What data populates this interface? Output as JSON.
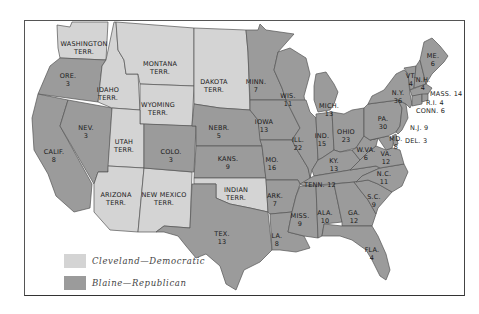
{
  "map": {
    "title": "Presidential Election of 1884",
    "colors": {
      "democrat": "#d4d4d4",
      "republican": "#9b9b9b",
      "border": "#555555"
    },
    "legend": [
      {
        "label": "Cleveland—Democratic",
        "party": "democrat"
      },
      {
        "label": "Blaine—Republican",
        "party": "republican"
      }
    ],
    "regions": [
      {
        "name": "WASHINGTON",
        "sub": "TERR.",
        "votes": null,
        "party": "territory"
      },
      {
        "name": "ORE.",
        "votes": "3",
        "party": "republican"
      },
      {
        "name": "CALIF.",
        "votes": "8",
        "party": "republican"
      },
      {
        "name": "NEV.",
        "votes": "3",
        "party": "republican"
      },
      {
        "name": "IDAHO",
        "sub": "TERR.",
        "votes": null,
        "party": "territory"
      },
      {
        "name": "MONTANA",
        "sub": "TERR.",
        "votes": null,
        "party": "territory"
      },
      {
        "name": "WYOMING",
        "sub": "TERR.",
        "votes": null,
        "party": "territory"
      },
      {
        "name": "UTAH",
        "sub": "TERR.",
        "votes": null,
        "party": "territory"
      },
      {
        "name": "ARIZONA",
        "sub": "TERR.",
        "votes": null,
        "party": "territory"
      },
      {
        "name": "NEW MEXICO",
        "sub": "TERR.",
        "votes": null,
        "party": "territory"
      },
      {
        "name": "DAKOTA",
        "sub": "TERR.",
        "votes": null,
        "party": "territory"
      },
      {
        "name": "COLO.",
        "votes": "3",
        "party": "republican"
      },
      {
        "name": "NEBR.",
        "votes": "5",
        "party": "republican"
      },
      {
        "name": "KANS.",
        "votes": "9",
        "party": "republican"
      },
      {
        "name": "INDIAN",
        "sub": "TERR.",
        "votes": null,
        "party": "territory"
      },
      {
        "name": "TEX.",
        "votes": "13",
        "party": "democrat"
      },
      {
        "name": "MINN.",
        "votes": "7",
        "party": "republican"
      },
      {
        "name": "IOWA",
        "votes": "13",
        "party": "republican"
      },
      {
        "name": "MO.",
        "votes": "16",
        "party": "democrat"
      },
      {
        "name": "ARK.",
        "votes": "7",
        "party": "democrat"
      },
      {
        "name": "LA.",
        "votes": "8",
        "party": "democrat"
      },
      {
        "name": "WIS.",
        "votes": "11",
        "party": "republican"
      },
      {
        "name": "ILL.",
        "votes": "22",
        "party": "republican"
      },
      {
        "name": "MICH.",
        "votes": "13",
        "party": "republican"
      },
      {
        "name": "IND.",
        "votes": "15",
        "party": "democrat"
      },
      {
        "name": "OHIO",
        "votes": "23",
        "party": "republican"
      },
      {
        "name": "KY.",
        "votes": "13",
        "party": "democrat"
      },
      {
        "name": "TENN.",
        "votes": "12",
        "party": "democrat"
      },
      {
        "name": "MISS.",
        "votes": "9",
        "party": "democrat"
      },
      {
        "name": "ALA.",
        "votes": "10",
        "party": "democrat"
      },
      {
        "name": "GA.",
        "votes": "12",
        "party": "democrat"
      },
      {
        "name": "FLA.",
        "votes": "4",
        "party": "democrat"
      },
      {
        "name": "S.C.",
        "votes": "9",
        "party": "democrat"
      },
      {
        "name": "N.C.",
        "votes": "11",
        "party": "democrat"
      },
      {
        "name": "VA.",
        "votes": "12",
        "party": "democrat"
      },
      {
        "name": "W.VA.",
        "votes": "6",
        "party": "democrat"
      },
      {
        "name": "MD.",
        "votes": "8",
        "party": "democrat"
      },
      {
        "name": "DEL.",
        "votes": "3",
        "party": "democrat"
      },
      {
        "name": "N.J.",
        "votes": "9",
        "party": "democrat"
      },
      {
        "name": "PA.",
        "votes": "30",
        "party": "republican"
      },
      {
        "name": "N.Y.",
        "votes": "36",
        "party": "democrat"
      },
      {
        "name": "CONN.",
        "votes": "6",
        "party": "democrat"
      },
      {
        "name": "R.I.",
        "votes": "4",
        "party": "republican"
      },
      {
        "name": "MASS.",
        "votes": "14",
        "party": "republican"
      },
      {
        "name": "VT.",
        "votes": "4",
        "party": "republican"
      },
      {
        "name": "N.H.",
        "votes": "4",
        "party": "republican"
      },
      {
        "name": "ME.",
        "votes": "6",
        "party": "republican"
      }
    ]
  }
}
